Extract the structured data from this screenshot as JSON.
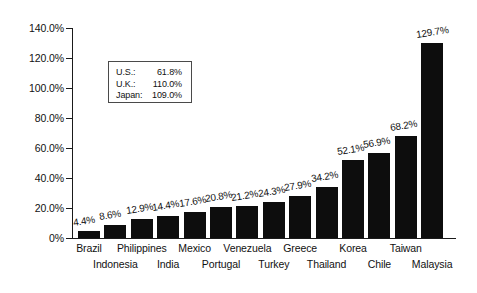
{
  "chart_data": {
    "type": "bar",
    "title": "",
    "subtitle": "",
    "xlabel": "",
    "ylabel": "",
    "ylim": [
      0,
      140
    ],
    "grid": false,
    "legend_position": "none",
    "orientation": "vertical",
    "bar_color": "#0d0d0d",
    "background_color": "#ffffff",
    "axis_color": "#1a1a1a",
    "categories": [
      "Brazil",
      "Indonesia",
      "Philippines",
      "India",
      "Mexico",
      "Portugal",
      "Venezuela",
      "Turkey",
      "Greece",
      "Thailand",
      "Korea",
      "Chile",
      "Taiwan",
      "Malaysia"
    ],
    "values": [
      4.4,
      8.6,
      12.9,
      14.4,
      17.6,
      20.8,
      21.2,
      24.3,
      27.9,
      34.2,
      52.1,
      56.9,
      68.2,
      129.7
    ],
    "value_labels": [
      "4.4%",
      "8.6%",
      "12.9%",
      "14.4%",
      "17.6%",
      "20.8%",
      "21.2%",
      "24.3%",
      "27.9%",
      "34.2%",
      "52.1%",
      "56.9%",
      "68.2%",
      "129.7%"
    ],
    "y_ticks": [
      0,
      20,
      40,
      60,
      80,
      100,
      120,
      140
    ],
    "y_tick_labels": [
      "0%",
      "20.0%",
      "40.0%",
      "60.0%",
      "80.0%",
      "100.0%",
      "120.0%",
      "140.0%"
    ],
    "annotations": [
      {
        "name": "U.S.:",
        "value": "61.8%"
      },
      {
        "name": "U.K.:",
        "value": "110.0%"
      },
      {
        "name": "Japan:",
        "value": "109.0%"
      }
    ]
  }
}
